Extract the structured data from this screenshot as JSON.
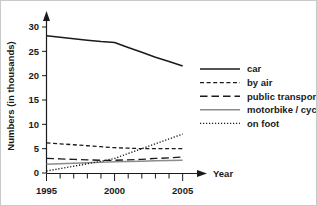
{
  "chart_data": {
    "type": "line",
    "title": "",
    "subtitle": "",
    "xlabel": "Year",
    "ylabel": "Numbers (in thousands)",
    "x": [
      1995,
      1996,
      1997,
      1998,
      1999,
      2000,
      2001,
      2002,
      2003,
      2004,
      2005
    ],
    "xtick_labels": [
      "1995",
      "2000",
      "2005"
    ],
    "xtick_values": [
      1995,
      2000,
      2005
    ],
    "xlim": [
      1995,
      2006.2
    ],
    "ytick_labels": [
      "0",
      "5",
      "10",
      "15",
      "20",
      "25",
      "30"
    ],
    "ytick_values": [
      0,
      5,
      10,
      15,
      20,
      25,
      30
    ],
    "ylim": [
      0,
      31.5
    ],
    "grid": false,
    "legend_position": "right",
    "series": [
      {
        "name": "car",
        "style": "solid",
        "color": "#1a1a1a",
        "values": [
          28.2,
          27.9,
          27.6,
          27.3,
          27.0,
          26.8,
          25.8,
          24.8,
          23.8,
          22.9,
          22.0
        ]
      },
      {
        "name": "by air",
        "style": "dashed",
        "color": "#1a1a1a",
        "values": [
          6.2,
          6.0,
          5.8,
          5.6,
          5.4,
          5.2,
          5.1,
          5.0,
          5.0,
          5.0,
          5.0
        ]
      },
      {
        "name": "public transport",
        "style": "long-dash",
        "color": "#1a1a1a",
        "values": [
          3.0,
          2.9,
          2.8,
          2.7,
          2.6,
          2.6,
          2.7,
          2.8,
          3.0,
          3.1,
          3.3
        ]
      },
      {
        "name": "motorbike / cycle",
        "style": "solid-gray",
        "color": "#8c8c8c",
        "values": [
          1.8,
          1.9,
          2.0,
          2.1,
          2.2,
          2.3,
          2.35,
          2.4,
          2.5,
          2.55,
          2.6
        ]
      },
      {
        "name": "on foot",
        "style": "dotted",
        "color": "#1a1a1a",
        "values": [
          0.4,
          0.9,
          1.4,
          1.9,
          2.4,
          3.0,
          4.0,
          5.0,
          6.0,
          7.0,
          8.0
        ]
      }
    ]
  },
  "legend": {
    "items": [
      {
        "label": "car"
      },
      {
        "label": "by air"
      },
      {
        "label": "public transport"
      },
      {
        "label": "motorbike / cycle"
      },
      {
        "label": "on foot"
      }
    ]
  },
  "colors": {
    "ink": "#1a1a1a",
    "gray_series": "#8c8c8c",
    "background": "#ffffff",
    "border": "#c9c9c9"
  }
}
